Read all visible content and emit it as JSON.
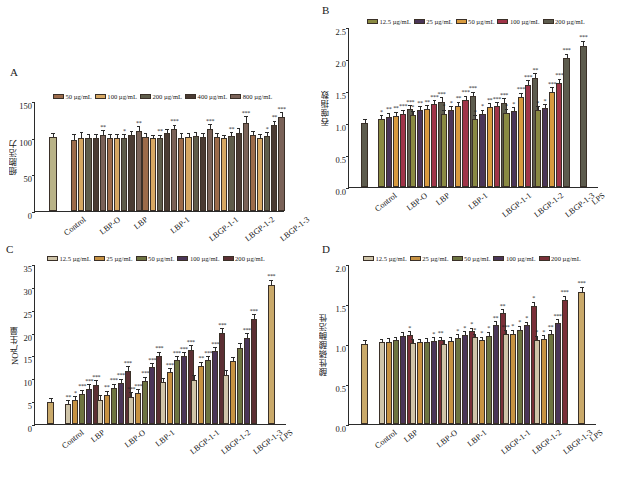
{
  "figure": {
    "width": 617,
    "height": 488,
    "background": "#ffffff"
  },
  "panels": [
    {
      "id": "A",
      "letter": "A",
      "ylabel": "细胞活力",
      "ylim": [
        0,
        150
      ],
      "yticks": [
        0,
        50,
        100,
        150
      ],
      "ytick_labels": [
        "0",
        "50",
        "100",
        "150"
      ],
      "legend": [
        {
          "label": "50 µg/mL",
          "color": "#9c6b4a"
        },
        {
          "label": "100 µg/mL",
          "color": "#d6a762"
        },
        {
          "label": "200 µg/mL",
          "color": "#5e5c4a"
        },
        {
          "label": "400 µg/mL",
          "color": "#4a3b33"
        },
        {
          "label": "800 µg/mL",
          "color": "#7a6258"
        }
      ],
      "categories": [
        "Control",
        "LBP-O",
        "LBP",
        "LBP-1",
        "LBGP-1-1",
        "LBGP-1-2",
        "LBGP-1-3"
      ],
      "control": {
        "value": 101,
        "err": 1.5,
        "color": "#b9b388"
      },
      "chart_data": {
        "type": "bar",
        "title": "",
        "xlabel": "",
        "ylabel": "细胞活力",
        "ylim": [
          0,
          150
        ],
        "categories": [
          "Control",
          "LBP-O",
          "LBP",
          "LBP-1",
          "LBGP-1-1",
          "LBGP-1-2",
          "LBGP-1-3"
        ],
        "series": [
          {
            "name": "50 µg/mL",
            "values": [
              null,
              97,
              100,
              101,
              100,
              101,
              103
            ]
          },
          {
            "name": "100 µg/mL",
            "values": [
              null,
              100,
              100,
              99,
              101,
              99,
              100
            ]
          },
          {
            "name": "200 µg/mL",
            "values": [
              null,
              99,
              99,
              99,
              102,
              102,
              102
            ]
          },
          {
            "name": "400 µg/mL",
            "values": [
              null,
              99,
              104,
              107,
              101,
              107,
              117
            ]
          },
          {
            "name": "800 µg/mL",
            "values": [
              null,
              104,
              109,
              112,
              112,
              120,
              128
            ]
          }
        ],
        "errors": [
          [
            null,
            4,
            2,
            1.5,
            3,
            1.5,
            3
          ],
          [
            null,
            5,
            2,
            1.5,
            2,
            1.5,
            2
          ],
          [
            null,
            2,
            2,
            1.5,
            2,
            2,
            2
          ],
          [
            null,
            2,
            2,
            2,
            2,
            3,
            3
          ],
          [
            null,
            3,
            3,
            2,
            3,
            6,
            3
          ]
        ],
        "significance": [
          [
            null,
            "",
            "",
            "",
            "",
            "",
            ""
          ],
          [
            null,
            "",
            "",
            "",
            "",
            "",
            ""
          ],
          [
            null,
            "",
            "*",
            "**",
            "",
            "**",
            "*"
          ],
          [
            null,
            "",
            "",
            "",
            "",
            "",
            "**"
          ],
          [
            null,
            "**",
            "**",
            "***",
            "***",
            "***",
            "***"
          ]
        ]
      }
    },
    {
      "id": "B",
      "letter": "B",
      "ylabel": "吞噬指数",
      "ylim": [
        0,
        2.5
      ],
      "yticks": [
        0,
        0.5,
        1.0,
        1.5,
        2.0,
        2.5
      ],
      "ytick_labels": [
        "0.0",
        "0.5",
        "1.0",
        "1.5",
        "2.0",
        "2.5"
      ],
      "legend": [
        {
          "label": "12.5 µg/mL",
          "color": "#8a8a42"
        },
        {
          "label": "25 µg/mL",
          "color": "#4a3558"
        },
        {
          "label": "50 µg/mL",
          "color": "#d89a3e"
        },
        {
          "label": "100 µg/mL",
          "color": "#a03448"
        },
        {
          "label": "200 µg/mL",
          "color": "#5d5c4e"
        }
      ],
      "categories": [
        "Control",
        "LBP-O",
        "LBP",
        "LBP-1",
        "LBGP-1-1",
        "LBGP-1-2",
        "LBGP-1-3",
        "LPS"
      ],
      "control": {
        "value": 1.0,
        "err": 0.015,
        "color": "#5d5c4e"
      },
      "lps": {
        "value": 2.2,
        "err": 0.04,
        "color": "#5d5c4e",
        "sig": "***"
      },
      "chart_data": {
        "type": "bar",
        "title": "",
        "xlabel": "",
        "ylabel": "吞噬指数",
        "ylim": [
          0,
          2.5
        ],
        "categories": [
          "Control",
          "LBP-O",
          "LBP",
          "LBP-1",
          "LBGP-1-1",
          "LBGP-1-2",
          "LBGP-1-3",
          "LPS"
        ],
        "series": [
          {
            "name": "12.5 µg/mL",
            "values": [
              null,
              1.06,
              1.13,
              1.14,
              1.06,
              1.155,
              1.2,
              null
            ]
          },
          {
            "name": "25 µg/mL",
            "values": [
              null,
              1.1,
              1.2,
              1.2,
              1.145,
              1.19,
              1.235,
              null
            ]
          },
          {
            "name": "50 µg/mL",
            "values": [
              null,
              1.115,
              1.215,
              1.27,
              1.25,
              1.4,
              1.49,
              null
            ]
          },
          {
            "name": "100 µg/mL",
            "values": [
              null,
              1.14,
              1.29,
              1.355,
              1.26,
              1.6,
              1.62,
              null
            ]
          },
          {
            "name": "200 µg/mL",
            "values": [
              null,
              1.215,
              1.33,
              1.42,
              1.32,
              1.7,
              2.01,
              null
            ]
          }
        ],
        "errors": [
          [
            null,
            0.02,
            0.025,
            0.025,
            0.02,
            0.02,
            0.025,
            null
          ],
          [
            null,
            0.02,
            0.02,
            0.025,
            0.02,
            0.02,
            0.02,
            null
          ],
          [
            null,
            0.02,
            0.02,
            0.025,
            0.02,
            0.03,
            0.03,
            null
          ],
          [
            null,
            0.025,
            0.025,
            0.03,
            0.025,
            0.03,
            0.03,
            null
          ],
          [
            null,
            0.025,
            0.03,
            0.03,
            0.025,
            0.04,
            0.03,
            null
          ]
        ],
        "significance": [
          [
            null,
            "*",
            "*",
            "*",
            "*",
            "*",
            "*",
            null
          ],
          [
            null,
            "**",
            "**",
            "*",
            "*",
            "*",
            "*",
            null
          ],
          [
            null,
            "**",
            "**",
            "**",
            "**",
            "***",
            "***",
            null
          ],
          [
            null,
            "***",
            "***",
            "***",
            "***",
            "***",
            "***",
            null
          ],
          [
            null,
            "***",
            "***",
            "***",
            "***",
            "**",
            "***",
            null
          ]
        ]
      }
    },
    {
      "id": "C",
      "letter": "C",
      "ylabel": "NO产生量",
      "ylim": [
        0,
        35
      ],
      "yticks": [
        0,
        5,
        10,
        15,
        20,
        25,
        30,
        35
      ],
      "ytick_labels": [
        "0",
        "5",
        "10",
        "15",
        "20",
        "25",
        "30",
        "35"
      ],
      "legend": [
        {
          "label": "12.5 µg/mL",
          "color": "#cfc4a8"
        },
        {
          "label": "25 µg/mL",
          "color": "#c79242"
        },
        {
          "label": "50 µg/mL",
          "color": "#6d7440"
        },
        {
          "label": "100 µg/mL",
          "color": "#4a3558"
        },
        {
          "label": "200 µg/mL",
          "color": "#5c2f33"
        }
      ],
      "categories": [
        "Control",
        "LBP",
        "LBP-O",
        "LBP-1",
        "LBGP-1-1",
        "LBGP-1-2",
        "LBGP-1-3",
        "LPS"
      ],
      "control": {
        "value": 4.8,
        "err": 0.3,
        "color": "#c9a96a"
      },
      "lps": {
        "value": 30.4,
        "err": 0.5,
        "color": "#c9a96a",
        "sig": "***"
      },
      "chart_data": {
        "type": "bar",
        "title": "",
        "xlabel": "",
        "ylabel": "NO产生量",
        "ylim": [
          0,
          35
        ],
        "categories": [
          "Control",
          "LBP",
          "LBP-O",
          "LBP-1",
          "LBGP-1-1",
          "LBGP-1-2",
          "LBGP-1-3",
          "LPS"
        ],
        "series": [
          {
            "name": "12.5 µg/mL",
            "values": [
              null,
              4.4,
              5.3,
              6.0,
              9.2,
              9.6,
              10.8,
              null
            ]
          },
          {
            "name": "25 µg/mL",
            "values": [
              null,
              5.2,
              6.3,
              6.7,
              11.3,
              12.7,
              13.7,
              null
            ]
          },
          {
            "name": "50 µg/mL",
            "values": [
              null,
              6.6,
              7.9,
              9.4,
              13.9,
              13.9,
              16.7,
              null
            ]
          },
          {
            "name": "100 µg/mL",
            "values": [
              null,
              7.7,
              9.0,
              12.4,
              14.8,
              15.9,
              18.9,
              null
            ]
          },
          {
            "name": "200 µg/mL",
            "values": [
              null,
              8.6,
              11.6,
              14.8,
              16.3,
              19.9,
              23.0,
              null
            ]
          }
        ],
        "errors": [
          [
            null,
            0.3,
            0.4,
            0.4,
            0.4,
            0.5,
            0.4,
            null
          ],
          [
            null,
            0.3,
            0.4,
            0.4,
            0.4,
            0.4,
            0.4,
            null
          ],
          [
            null,
            0.4,
            0.4,
            0.4,
            0.4,
            0.4,
            0.5,
            null
          ],
          [
            null,
            0.4,
            0.4,
            0.4,
            0.4,
            0.4,
            0.4,
            null
          ],
          [
            null,
            0.4,
            0.5,
            0.5,
            0.4,
            0.5,
            0.5,
            null
          ]
        ],
        "significance": [
          [
            null,
            "**",
            "",
            "***",
            "",
            "",
            "",
            null
          ],
          [
            null,
            "*",
            "**",
            "***",
            "***",
            "**",
            "",
            null
          ],
          [
            null,
            "***",
            "***",
            "***",
            "***",
            "***",
            "",
            null
          ],
          [
            null,
            "***",
            "***",
            "***",
            "***",
            "***",
            "***",
            null
          ],
          [
            null,
            "***",
            "***",
            "***",
            "***",
            "***",
            "***",
            null
          ]
        ]
      }
    },
    {
      "id": "D",
      "letter": "D",
      "ylabel": "酸性磷酸酶活性",
      "ylim": [
        0,
        2.0
      ],
      "yticks": [
        0,
        0.5,
        1.0,
        1.5,
        2.0
      ],
      "ytick_labels": [
        "0.0",
        "0.5",
        "1.0",
        "1.5",
        "2.0"
      ],
      "legend": [
        {
          "label": "12.5 µg/mL",
          "color": "#cfc4a8"
        },
        {
          "label": "25 µg/mL",
          "color": "#c79242"
        },
        {
          "label": "50 µg/mL",
          "color": "#6d7440"
        },
        {
          "label": "100 µg/mL",
          "color": "#4a3558"
        },
        {
          "label": "200 µg/mL",
          "color": "#7a2f38"
        }
      ],
      "categories": [
        "Control",
        "LBP",
        "LBP-O",
        "LBP-1",
        "LBGP-1-1",
        "LBGP-1-2",
        "LBGP-1-3",
        "LPS"
      ],
      "control": {
        "value": 1.0,
        "err": 0.015,
        "color": "#c9a96a"
      },
      "lps": {
        "value": 1.655,
        "err": 0.02,
        "color": "#c9a96a",
        "sig": "***"
      },
      "chart_data": {
        "type": "bar",
        "title": "",
        "xlabel": "",
        "ylabel": "酸性磷酸酶活性",
        "ylim": [
          0,
          2.0
        ],
        "categories": [
          "Control",
          "LBP",
          "LBP-O",
          "LBP-1",
          "LBGP-1-1",
          "LBGP-1-2",
          "LBGP-1-3",
          "LPS"
        ],
        "series": [
          {
            "name": "12.5 µg/mL",
            "values": [
              null,
              1.02,
              1.015,
              1.005,
              1.085,
              1.125,
              1.055,
              null
            ]
          },
          {
            "name": "25 µg/mL",
            "values": [
              null,
              1.03,
              1.025,
              1.04,
              1.05,
              1.13,
              1.065,
              null
            ]
          },
          {
            "name": "50 µg/mL",
            "values": [
              null,
              1.05,
              1.03,
              1.075,
              1.105,
              1.18,
              1.125,
              null
            ]
          },
          {
            "name": "100 µg/mL",
            "values": [
              null,
              1.1,
              1.04,
              1.115,
              1.235,
              1.235,
              1.26,
              null
            ]
          },
          {
            "name": "200 µg/mL",
            "values": [
              null,
              1.115,
              1.045,
              1.16,
              1.385,
              1.475,
              1.555,
              null
            ]
          }
        ],
        "errors": [
          [
            null,
            0.012,
            0.012,
            0.012,
            0.015,
            0.015,
            0.015,
            null
          ],
          [
            null,
            0.012,
            0.012,
            0.012,
            0.012,
            0.015,
            0.012,
            null
          ],
          [
            null,
            0.012,
            0.012,
            0.015,
            0.015,
            0.015,
            0.015,
            null
          ],
          [
            null,
            0.015,
            0.012,
            0.015,
            0.02,
            0.015,
            0.02,
            null
          ],
          [
            null,
            0.015,
            0.012,
            0.015,
            0.02,
            0.02,
            0.02,
            null
          ]
        ],
        "significance": [
          [
            null,
            "",
            "",
            "",
            "*",
            "***",
            "*",
            null
          ],
          [
            null,
            "",
            "",
            "",
            "*",
            "*",
            "*",
            null
          ],
          [
            null,
            "",
            "",
            "*",
            "*",
            "*",
            "**",
            null
          ],
          [
            null,
            "",
            "*",
            "*",
            "**",
            "*",
            "***",
            null
          ],
          [
            null,
            "*",
            "**",
            "*",
            "**",
            "*",
            "***",
            null
          ]
        ]
      }
    }
  ]
}
